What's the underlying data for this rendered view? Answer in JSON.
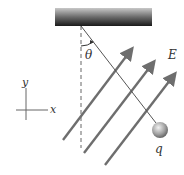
{
  "diagram": {
    "labels": {
      "angle": "θ",
      "field": "E",
      "charge": "q",
      "y_axis": "y",
      "x_axis": "x"
    },
    "colors": {
      "ceiling_dark": "#1a1a1a",
      "ceiling_light": "#9a9a9a",
      "field_lines": "#6e6e6e",
      "string": "#555555",
      "ball": "#9c9c9c",
      "dashed": "#666666"
    },
    "elements": {
      "ceiling": "Hatched ceiling support",
      "string": "String from pivot to charge",
      "vertical_reference": "Dashed vertical reference line",
      "field_arrows_count": "4",
      "charge": "Charged sphere"
    }
  }
}
